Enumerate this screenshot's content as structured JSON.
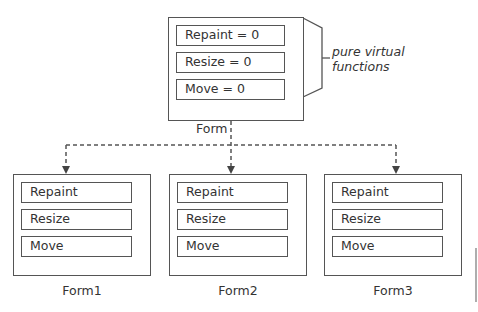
{
  "base_class": {
    "name": "Form",
    "methods": [
      "Repaint = 0",
      "Resize = 0",
      "Move = 0"
    ]
  },
  "annotation": {
    "line1": "pure virtual",
    "line2": "functions"
  },
  "derived_classes": [
    {
      "name": "Form1",
      "methods": [
        "Repaint",
        "Resize",
        "Move"
      ]
    },
    {
      "name": "Form2",
      "methods": [
        "Repaint",
        "Resize",
        "Move"
      ]
    },
    {
      "name": "Form3",
      "methods": [
        "Repaint",
        "Resize",
        "Move"
      ]
    }
  ],
  "colors": {
    "line": "#555555",
    "text": "#333333",
    "background": "#ffffff"
  }
}
